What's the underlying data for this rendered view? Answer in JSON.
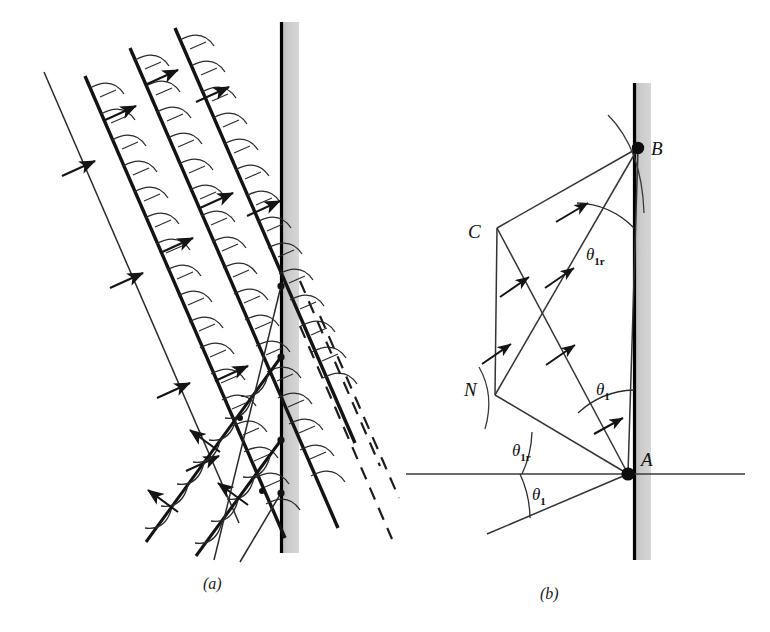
{
  "figure": {
    "panels": [
      {
        "id": "a",
        "caption": "(a)",
        "description": "Incident and reflected wavefronts with Huygens wavelets at a reflecting barrier"
      },
      {
        "id": "b",
        "caption": "(b)",
        "description": "Ray geometry showing incident ray, reflected ray, normal N, and points A, B, C"
      }
    ],
    "captions": {
      "a": "(a)",
      "b": "(b)"
    },
    "points": {
      "A": "A",
      "B": "B",
      "C": "C",
      "N": "N"
    },
    "angles": {
      "theta1_upper": "θ",
      "theta1_upper_sub": "1",
      "theta1r_upper": "θ",
      "theta1r_upper_sub": "1r",
      "theta1r_lower": "θ",
      "theta1r_lower_sub": "1r",
      "theta1_lower": "θ",
      "theta1_lower_sub": "1"
    },
    "angle_labels": [
      {
        "name": "theta-1r-at-B",
        "glyph": "θ",
        "subscript": "1r",
        "x": 588,
        "y": 258
      },
      {
        "name": "theta-1-at-A-upper",
        "glyph": "θ",
        "subscript": "1",
        "x": 598,
        "y": 393
      },
      {
        "name": "theta-1r-at-A-lower",
        "glyph": "θ",
        "subscript": "1r",
        "x": 516,
        "y": 455
      },
      {
        "name": "theta-1-at-A-bottom",
        "glyph": "θ",
        "subscript": "1",
        "x": 535,
        "y": 498
      }
    ],
    "point_labels": [
      {
        "name": "point-B",
        "glyph": "B",
        "x": 651,
        "y": 155
      },
      {
        "name": "point-C",
        "glyph": "C",
        "x": 468,
        "y": 238
      },
      {
        "name": "point-N",
        "glyph": "N",
        "x": 466,
        "y": 395
      },
      {
        "name": "point-A",
        "glyph": "A",
        "x": 641,
        "y": 466
      }
    ],
    "colors": {
      "ink": "#111111",
      "barrier_face": "#000000",
      "barrier_fill": "#c9c9c9",
      "background": "#ffffff",
      "ray": "#2a2a2a"
    },
    "barrier_a": {
      "x_line": 281,
      "x_fill_left": 283,
      "x_fill_right": 299,
      "y_top": 22,
      "y_bottom": 553
    },
    "barrier_b": {
      "x_line": 634,
      "x_fill_left": 636,
      "x_fill_right": 651,
      "y_top": 83,
      "y_bottom": 560
    }
  }
}
